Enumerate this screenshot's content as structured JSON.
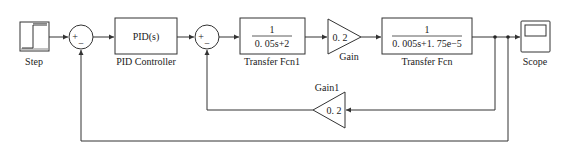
{
  "diagram": {
    "blocks": {
      "step": {
        "label": "Step"
      },
      "sum1": {
        "signs": [
          "+",
          "−"
        ]
      },
      "pid": {
        "content": "PID(s)",
        "label": "PID Controller"
      },
      "sum2": {
        "signs": [
          "+",
          "−"
        ]
      },
      "tf1": {
        "numerator": "1",
        "denominator": "0. 05s+2",
        "label": "Transfer Fcn1"
      },
      "gain": {
        "value": "0. 2",
        "label": "Gain"
      },
      "tf": {
        "numerator": "1",
        "denominator": "0. 005s+1. 75e−5",
        "label": "Transfer Fcn"
      },
      "scope": {
        "label": "Scope"
      },
      "gain1": {
        "value": "0. 2",
        "label": "Gain1"
      }
    },
    "colors": {
      "line": "#333333",
      "background": "#ffffff"
    }
  }
}
